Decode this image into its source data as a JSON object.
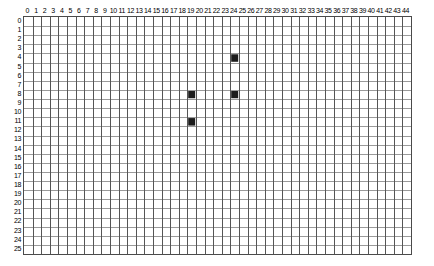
{
  "grid": {
    "columns": {
      "count": 45,
      "labels": [
        "0",
        "1",
        "2",
        "3",
        "4",
        "5",
        "6",
        "7",
        "8",
        "9",
        "10",
        "11",
        "12",
        "13",
        "14",
        "15",
        "16",
        "17",
        "18",
        "19",
        "20",
        "21",
        "22",
        "23",
        "24",
        "25",
        "26",
        "27",
        "28",
        "29",
        "30",
        "31",
        "32",
        "33",
        "34",
        "35",
        "36",
        "37",
        "38",
        "39",
        "40",
        "41",
        "42",
        "43",
        "44"
      ]
    },
    "rows": {
      "count": 26,
      "labels": [
        "0",
        "1",
        "2",
        "3",
        "4",
        "5",
        "6",
        "7",
        "8",
        "9",
        "10",
        "11",
        "12",
        "13",
        "14",
        "15",
        "16",
        "17",
        "18",
        "19",
        "20",
        "21",
        "22",
        "23",
        "24",
        "25"
      ]
    },
    "colors": {
      "filled_cell": "#1c1c1c",
      "vertical_gridline": "#555555",
      "horizontal_gridline": "#9a9a9a",
      "border": "#4a4a4a",
      "background": "#ffffff",
      "label_text": "#000000"
    },
    "filled_cells": [
      {
        "col": 24,
        "row": 4
      },
      {
        "col": 19,
        "row": 8
      },
      {
        "col": 24,
        "row": 8
      },
      {
        "col": 19,
        "row": 11
      }
    ]
  },
  "chart_data": {
    "type": "heatmap",
    "title": "",
    "xlabel": "",
    "ylabel": "",
    "x": [
      0,
      1,
      2,
      3,
      4,
      5,
      6,
      7,
      8,
      9,
      10,
      11,
      12,
      13,
      14,
      15,
      16,
      17,
      18,
      19,
      20,
      21,
      22,
      23,
      24,
      25,
      26,
      27,
      28,
      29,
      30,
      31,
      32,
      33,
      34,
      35,
      36,
      37,
      38,
      39,
      40,
      41,
      42,
      43,
      44
    ],
    "y": [
      0,
      1,
      2,
      3,
      4,
      5,
      6,
      7,
      8,
      9,
      10,
      11,
      12,
      13,
      14,
      15,
      16,
      17,
      18,
      19,
      20,
      21,
      22,
      23,
      24,
      25
    ],
    "xlim": [
      0,
      44
    ],
    "ylim": [
      0,
      25
    ],
    "grid": true,
    "legend": "none",
    "marked_points": [
      {
        "x": 24,
        "y": 4,
        "value": 1
      },
      {
        "x": 19,
        "y": 8,
        "value": 1
      },
      {
        "x": 24,
        "y": 8,
        "value": 1
      },
      {
        "x": 19,
        "y": 11,
        "value": 1
      }
    ],
    "note": "Binary occupancy grid: 45 columns by 26 rows; all cells are 0 (empty) except four cells set to 1 (filled black)."
  }
}
